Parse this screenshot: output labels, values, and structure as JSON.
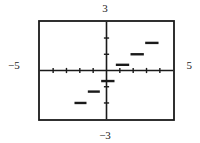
{
  "graph": {
    "labels": {
      "ymax": "3",
      "ymin": "−3",
      "xmin": "−5",
      "xmax": "5"
    },
    "colors": {
      "frame": "#1a1a1a",
      "axis": "#1a1a1a",
      "curve": "#1a1a1a",
      "background": "#ffffff"
    }
  },
  "chart_data": {
    "type": "line",
    "title": "",
    "subtitle": "",
    "xlabel": "",
    "ylabel": "",
    "xlim": [
      -5,
      5
    ],
    "ylim": [
      -3,
      3
    ],
    "grid": false,
    "legend": null,
    "x_ticks": [
      -4,
      -3,
      -2,
      -1,
      1,
      2,
      3,
      4
    ],
    "y_ticks": [
      -2,
      -1,
      1,
      2
    ],
    "x_tick_labels": [],
    "y_tick_labels": [],
    "annotations": [
      {
        "text": "3",
        "position": "top",
        "value": 3
      },
      {
        "text": "−3",
        "position": "bottom",
        "value": -3
      },
      {
        "text": "−5",
        "position": "left",
        "value": -5
      },
      {
        "text": "5",
        "position": "right",
        "value": 5
      }
    ],
    "series": [
      {
        "name": "step-function",
        "style": "horizontal-segments",
        "segments": [
          {
            "x_start": -2.4,
            "x_end": -1.5,
            "y": -2.0
          },
          {
            "x_start": -1.4,
            "x_end": -0.5,
            "y": -1.3
          },
          {
            "x_start": -0.4,
            "x_end": 0.6,
            "y": -0.65
          },
          {
            "x_start": 0.7,
            "x_end": 1.7,
            "y": 0.35
          },
          {
            "x_start": 1.8,
            "x_end": 2.8,
            "y": 1.0
          },
          {
            "x_start": 2.9,
            "x_end": 3.9,
            "y": 1.7
          }
        ]
      }
    ]
  }
}
